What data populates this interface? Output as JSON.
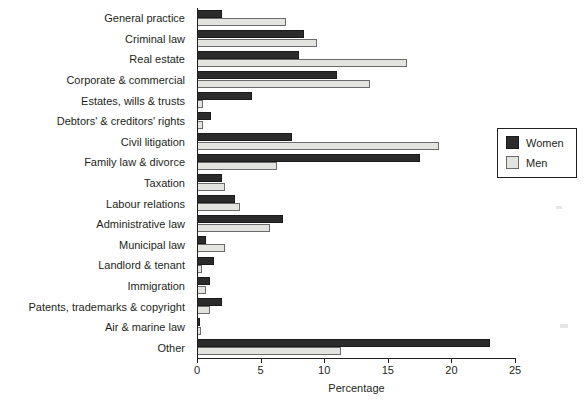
{
  "chart_data": {
    "type": "bar",
    "orientation": "horizontal",
    "title": "",
    "xlabel": "Percentage",
    "ylabel": "",
    "xlim": [
      0,
      25
    ],
    "xticks": [
      0,
      5,
      10,
      15,
      20,
      25
    ],
    "grid": false,
    "legend_position": "right",
    "categories": [
      "General practice",
      "Criminal law",
      "Real estate",
      "Corporate & commercial",
      "Estates, wills & trusts",
      "Debtors' & creditors' rights",
      "Civil litigation",
      "Family law & divorce",
      "Taxation",
      "Labour relations",
      "Administrative law",
      "Municipal law",
      "Landlord & tenant",
      "Immigration",
      "Patents, trademarks & copyright",
      "Air & marine law",
      "Other"
    ],
    "series": [
      {
        "name": "Women",
        "color": "#2b2b2b",
        "values": [
          2.0,
          8.4,
          8.0,
          11.0,
          4.3,
          1.1,
          7.5,
          17.5,
          2.0,
          3.0,
          6.8,
          0.7,
          1.3,
          1.0,
          2.0,
          0.1,
          23.0
        ]
      },
      {
        "name": "Men",
        "color": "#e3e3e0",
        "values": [
          7.0,
          9.4,
          16.5,
          13.6,
          0.5,
          0.5,
          19.0,
          6.3,
          2.2,
          3.4,
          5.7,
          2.2,
          0.4,
          0.7,
          1.0,
          0.3,
          11.3
        ]
      }
    ]
  },
  "legend": {
    "items": [
      {
        "label": "Women",
        "swatch": "women-swatch"
      },
      {
        "label": "Men",
        "swatch": "men-swatch"
      }
    ]
  },
  "axis": {
    "x_title": "Percentage",
    "tick_labels": [
      "0",
      "5",
      "10",
      "15",
      "20",
      "25"
    ]
  }
}
